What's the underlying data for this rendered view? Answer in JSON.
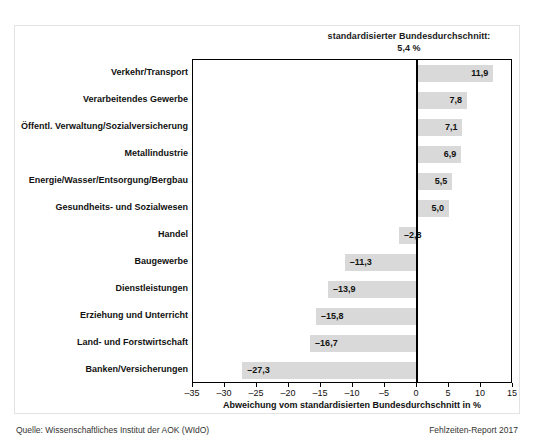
{
  "annotation": {
    "line1": "standardisierter Bundesdurchschnitt:",
    "line2": "5,4 %"
  },
  "footer": {
    "source": "Quelle: Wissenschaftliches Institut der AOK (WIdO)",
    "report": "Fehlzeiten-Report 2017"
  },
  "chart_data": {
    "type": "bar",
    "orientation": "horizontal",
    "title": "",
    "xlabel": "Abweichung vom standardisierten Bundesdurchschnitt in %",
    "ylabel": "",
    "xlim": [
      -35,
      15
    ],
    "xticks": [
      -35,
      -30,
      -25,
      -20,
      -15,
      -10,
      -5,
      0,
      5,
      10,
      15
    ],
    "xtick_labels": [
      "–35",
      "–30",
      "–25",
      "–20",
      "–15",
      "–10",
      "–5",
      "0",
      "5",
      "10",
      "15"
    ],
    "grid": false,
    "legend": null,
    "reference_line": 0,
    "bar_color": "#d9d9d9",
    "categories": [
      "Verkehr/Transport",
      "Verarbeitendes Gewerbe",
      "Öffentl. Verwaltung/Sozialversicherung",
      "Metallindustrie",
      "Energie/Wasser/Entsorgung/Bergbau",
      "Gesundheits- und Sozialwesen",
      "Handel",
      "Baugewerbe",
      "Dienstleistungen",
      "Erziehung und Unterricht",
      "Land- und Forstwirtschaft",
      "Banken/Versicherungen"
    ],
    "values": [
      11.9,
      7.8,
      7.1,
      6.9,
      5.5,
      5.0,
      -2.8,
      -11.3,
      -13.9,
      -15.8,
      -16.7,
      -27.3
    ],
    "value_labels": [
      "11,9",
      "7,8",
      "7,1",
      "6,9",
      "5,5",
      "5,0",
      "–2,8",
      "–11,3",
      "–13,9",
      "–15,8",
      "–16,7",
      "–27,3"
    ],
    "annotation_text": "standardisierter Bundesdurchschnitt: 5,4 %",
    "annotation_value": 5.4
  }
}
